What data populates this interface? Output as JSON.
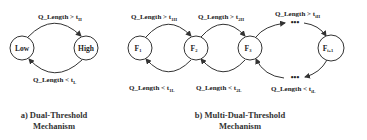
{
  "diagram_a": {
    "nodes": [
      {
        "id": "low",
        "label": "Low"
      },
      {
        "id": "high",
        "label": "High"
      }
    ],
    "edges": [
      {
        "from": "low",
        "to": "high",
        "label_main": "Q_Length > t",
        "label_sub": "H"
      },
      {
        "from": "high",
        "to": "low",
        "label_main": "Q_Length < t",
        "label_sub": "L"
      }
    ],
    "caption_line1": "a) Dual-Threshold",
    "caption_line2": "Mechanism"
  },
  "diagram_b": {
    "nodes": [
      {
        "id": "f1",
        "label": "F",
        "sub": "1"
      },
      {
        "id": "f2",
        "label": "F",
        "sub": "2"
      },
      {
        "id": "f3",
        "label": "F",
        "sub": "3"
      },
      {
        "id": "fi1",
        "label": "F",
        "sub": "i+1"
      }
    ],
    "edges_up": [
      {
        "from": "f1",
        "to": "f2",
        "label_main": "Q_Length > t",
        "label_sub": "1H"
      },
      {
        "from": "f2",
        "to": "f3",
        "label_main": "Q_Length > t",
        "label_sub": "2H"
      },
      {
        "from": "f3",
        "to": "fi1",
        "label_main": "Q_Length > t",
        "label_sub": "iH"
      }
    ],
    "edges_down": [
      {
        "from": "f2",
        "to": "f1",
        "label_main": "Q_Length < t",
        "label_sub": "1L"
      },
      {
        "from": "f3",
        "to": "f2",
        "label_main": "Q_Length < t",
        "label_sub": "2L"
      },
      {
        "from": "fi1",
        "to": "f3",
        "label_main": "Q_Length < t",
        "label_sub": "iL"
      }
    ],
    "ellipsis": "•••",
    "caption_line1": "b) Multi-Dual-Threshold",
    "caption_line2": "Mechanism"
  },
  "colors": {
    "stroke": "#333333",
    "text": "#222222",
    "background": "#ffffff"
  }
}
